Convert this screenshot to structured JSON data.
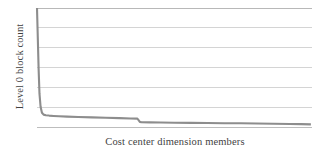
{
  "chart_data": {
    "type": "line",
    "title": "",
    "xlabel": "Cost center dimension members",
    "ylabel": "Level 0 block count",
    "grid": true,
    "legend": false,
    "legend_position": "none",
    "series_color": "#8d8d8d",
    "grid_color": "#c9c9c9",
    "background_color": "#ffffff",
    "xlim": [
      0,
      100
    ],
    "ylim": [
      0,
      100
    ],
    "x_tick_labels": [],
    "y_tick_labels": [],
    "gridline_values": [
      0,
      16.7,
      33.3,
      50,
      66.7,
      83.3,
      100
    ],
    "series": [
      {
        "name": "Level 0 block count",
        "x": [
          0.0,
          0.3,
          0.6,
          0.9,
          1.3,
          1.8,
          2.4,
          3.2,
          4.4,
          6.0,
          8.0,
          11.0,
          15.0,
          20.0,
          25.0,
          30.0,
          34.0,
          36.5,
          37.0,
          37.4,
          38.0,
          41.0,
          45.0,
          50.0,
          56.0,
          62.0,
          68.0,
          74.0,
          80.0,
          86.0,
          92.0,
          96.0,
          99.6
        ],
        "values": [
          100.0,
          74.0,
          48.0,
          28.0,
          17.0,
          12.0,
          10.4,
          9.9,
          9.6,
          9.3,
          9.0,
          8.7,
          8.4,
          8.1,
          7.8,
          7.5,
          7.2,
          7.0,
          5.6,
          4.3,
          4.0,
          3.9,
          3.8,
          3.6,
          3.5,
          3.4,
          3.2,
          3.1,
          2.9,
          2.7,
          2.5,
          2.4,
          2.2
        ]
      }
    ]
  },
  "axes": {
    "y_title": "Level 0 block count",
    "x_title": "Cost center dimension members"
  }
}
